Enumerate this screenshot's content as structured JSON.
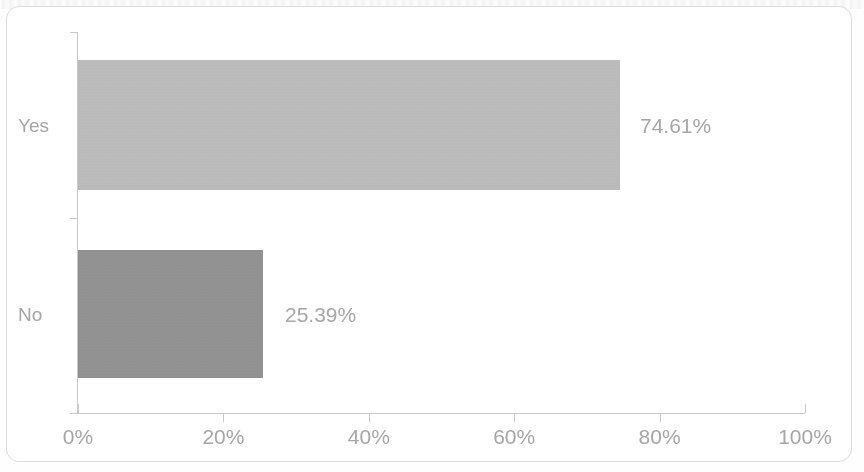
{
  "chart_data": {
    "type": "bar",
    "orientation": "horizontal",
    "title": "",
    "xlabel": "",
    "ylabel": "",
    "categories": [
      "Yes",
      "No"
    ],
    "values": [
      74.61,
      25.39
    ],
    "value_labels": [
      "74.61%",
      "25.39%"
    ],
    "xlim": [
      0,
      100
    ],
    "x_ticks": [
      0,
      20,
      40,
      60,
      80,
      100
    ],
    "x_tick_labels": [
      "0%",
      "20%",
      "40%",
      "60%",
      "80%",
      "100%"
    ],
    "grid": false,
    "legend": false,
    "legend_position": "none",
    "bar_colors": [
      "#bfbfbf",
      "#959595"
    ],
    "axis_color": "#c9c9c9",
    "text_color": "#a6a6a6",
    "frame_border_color": "#dcdcdc",
    "background_color": "#ffffff"
  }
}
